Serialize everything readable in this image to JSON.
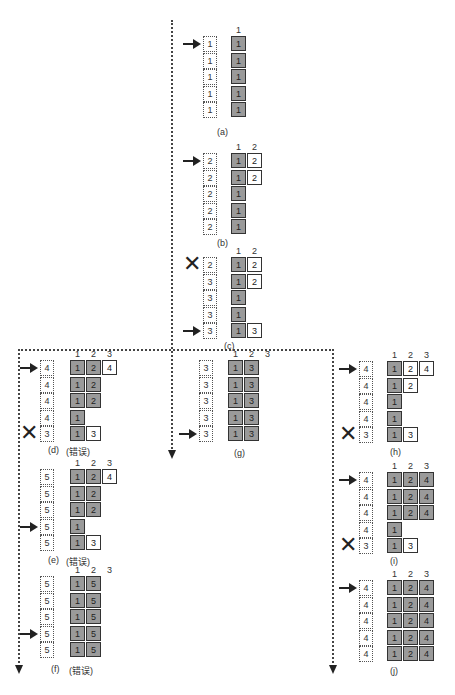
{
  "colors": {
    "filled_cell": "#9a9a9a",
    "empty_cell": "#ffffff",
    "line": "#444444"
  },
  "panels": {
    "a": {
      "caption": "(a)",
      "col_headers": [
        "1"
      ],
      "queue": [
        "1",
        "1",
        "1",
        "1",
        "1"
      ],
      "pointer_row": 0,
      "x_row": null,
      "rows": [
        [
          [
            "1",
            "g"
          ]
        ],
        [
          [
            "1",
            "g"
          ]
        ],
        [
          [
            "1",
            "g"
          ]
        ],
        [
          [
            "1",
            "g"
          ]
        ],
        [
          [
            "1",
            "g"
          ]
        ]
      ]
    },
    "b": {
      "caption": "(b)",
      "col_headers": [
        "1",
        "2"
      ],
      "queue": [
        "2",
        "2",
        "2",
        "2",
        "2"
      ],
      "pointer_row": 0,
      "x_row": null,
      "rows": [
        [
          [
            "1",
            "g"
          ],
          [
            "2",
            "w"
          ]
        ],
        [
          [
            "1",
            "g"
          ],
          [
            "2",
            "w"
          ]
        ],
        [
          [
            "1",
            "g"
          ]
        ],
        [
          [
            "1",
            "g"
          ]
        ],
        [
          [
            "1",
            "g"
          ]
        ]
      ]
    },
    "c": {
      "caption": "(c)",
      "col_headers": [
        "1",
        "2"
      ],
      "queue": [
        "2",
        "3",
        "3",
        "3",
        "3"
      ],
      "pointer_row": 4,
      "x_row": 0,
      "rows": [
        [
          [
            "1",
            "g"
          ],
          [
            "2",
            "w"
          ]
        ],
        [
          [
            "1",
            "g"
          ],
          [
            "2",
            "w"
          ]
        ],
        [
          [
            "1",
            "g"
          ]
        ],
        [
          [
            "1",
            "g"
          ]
        ],
        [
          [
            "1",
            "g"
          ],
          [
            "3",
            "w"
          ]
        ]
      ]
    },
    "d": {
      "caption": "(d)",
      "note": "(错误)",
      "col_headers": [
        "1",
        "2",
        "3"
      ],
      "queue": [
        "4",
        "4",
        "4",
        "4",
        "3"
      ],
      "pointer_row": 0,
      "x_row": 4,
      "rows": [
        [
          [
            "1",
            "g"
          ],
          [
            "2",
            "g"
          ],
          [
            "4",
            "w"
          ]
        ],
        [
          [
            "1",
            "g"
          ],
          [
            "2",
            "g"
          ]
        ],
        [
          [
            "1",
            "g"
          ],
          [
            "2",
            "g"
          ]
        ],
        [
          [
            "1",
            "g"
          ]
        ],
        [
          [
            "1",
            "g"
          ],
          [
            "3",
            "w"
          ]
        ]
      ]
    },
    "e": {
      "caption": "(e)",
      "note": "(错误)",
      "col_headers": [
        "1",
        "2",
        "3"
      ],
      "queue": [
        "5",
        "5",
        "5",
        "5",
        "5"
      ],
      "pointer_row": 3,
      "x_row": null,
      "rows": [
        [
          [
            "1",
            "g"
          ],
          [
            "2",
            "g"
          ],
          [
            "4",
            "w"
          ]
        ],
        [
          [
            "1",
            "g"
          ],
          [
            "2",
            "g"
          ]
        ],
        [
          [
            "1",
            "g"
          ],
          [
            "2",
            "g"
          ]
        ],
        [
          [
            "1",
            "g"
          ]
        ],
        [
          [
            "1",
            "g"
          ],
          [
            "3",
            "w"
          ]
        ]
      ]
    },
    "f": {
      "caption": "(f)",
      "note": "(错误)",
      "col_headers": [
        "1",
        "2",
        "3"
      ],
      "queue": [
        "5",
        "5",
        "5",
        "5",
        "5"
      ],
      "pointer_row": 3,
      "x_row": null,
      "rows": [
        [
          [
            "1",
            "g"
          ],
          [
            "5",
            "g"
          ]
        ],
        [
          [
            "1",
            "g"
          ],
          [
            "5",
            "g"
          ]
        ],
        [
          [
            "1",
            "g"
          ],
          [
            "5",
            "g"
          ]
        ],
        [
          [
            "1",
            "g"
          ],
          [
            "5",
            "g"
          ]
        ],
        [
          [
            "1",
            "g"
          ],
          [
            "5",
            "g"
          ]
        ]
      ]
    },
    "g": {
      "caption": "(g)",
      "col_headers": [
        "1",
        "2",
        "3"
      ],
      "queue": [
        "3",
        "3",
        "3",
        "3",
        "3"
      ],
      "pointer_row": 4,
      "x_row": null,
      "rows": [
        [
          [
            "1",
            "g"
          ],
          [
            "3",
            "g"
          ]
        ],
        [
          [
            "1",
            "g"
          ],
          [
            "3",
            "g"
          ]
        ],
        [
          [
            "1",
            "g"
          ],
          [
            "3",
            "g"
          ]
        ],
        [
          [
            "1",
            "g"
          ],
          [
            "3",
            "g"
          ]
        ],
        [
          [
            "1",
            "g"
          ],
          [
            "3",
            "g"
          ]
        ]
      ]
    },
    "h": {
      "caption": "(h)",
      "col_headers": [
        "1",
        "2",
        "3"
      ],
      "queue": [
        "4",
        "4",
        "4",
        "4",
        "3"
      ],
      "pointer_row": 0,
      "x_row": 4,
      "rows": [
        [
          [
            "1",
            "g"
          ],
          [
            "2",
            "w"
          ],
          [
            "4",
            "w"
          ]
        ],
        [
          [
            "1",
            "g"
          ],
          [
            "2",
            "w"
          ]
        ],
        [
          [
            "1",
            "g"
          ]
        ],
        [
          [
            "1",
            "g"
          ]
        ],
        [
          [
            "1",
            "g"
          ],
          [
            "3",
            "w"
          ]
        ]
      ]
    },
    "i": {
      "caption": "(i)",
      "col_headers": [
        "1",
        "2",
        "3"
      ],
      "queue": [
        "4",
        "4",
        "4",
        "4",
        "3"
      ],
      "pointer_row": 0,
      "x_row": 4,
      "rows": [
        [
          [
            "1",
            "g"
          ],
          [
            "2",
            "g"
          ],
          [
            "4",
            "g"
          ]
        ],
        [
          [
            "1",
            "g"
          ],
          [
            "2",
            "g"
          ],
          [
            "4",
            "g"
          ]
        ],
        [
          [
            "1",
            "g"
          ],
          [
            "2",
            "g"
          ],
          [
            "4",
            "g"
          ]
        ],
        [
          [
            "1",
            "g"
          ]
        ],
        [
          [
            "1",
            "g"
          ],
          [
            "3",
            "w"
          ]
        ]
      ]
    },
    "j": {
      "caption": "(j)",
      "col_headers": [
        "1",
        "2",
        "3"
      ],
      "queue": [
        "4",
        "4",
        "4",
        "4",
        "4"
      ],
      "pointer_row": 0,
      "x_row": null,
      "rows": [
        [
          [
            "1",
            "g"
          ],
          [
            "2",
            "g"
          ],
          [
            "4",
            "g"
          ]
        ],
        [
          [
            "1",
            "g"
          ],
          [
            "2",
            "g"
          ],
          [
            "4",
            "g"
          ]
        ],
        [
          [
            "1",
            "g"
          ],
          [
            "2",
            "g"
          ],
          [
            "4",
            "g"
          ]
        ],
        [
          [
            "1",
            "g"
          ],
          [
            "2",
            "g"
          ],
          [
            "4",
            "g"
          ]
        ],
        [
          [
            "1",
            "g"
          ],
          [
            "2",
            "g"
          ],
          [
            "4",
            "g"
          ]
        ]
      ]
    }
  },
  "symbols": {
    "pointer": "arrow-right",
    "reject": "✕"
  }
}
